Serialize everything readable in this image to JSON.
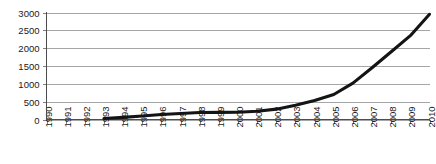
{
  "chart_data": {
    "type": "line",
    "title": "",
    "subtitle": "",
    "xlabel": "",
    "ylabel": "",
    "grid": "horizontal",
    "legend": "none",
    "xlim": [
      1990,
      2010
    ],
    "ylim": [
      0,
      3000
    ],
    "ytick_labels": [
      "0",
      "500",
      "1000",
      "1500",
      "2000",
      "2500",
      "3000"
    ],
    "ytick_values": [
      0,
      500,
      1000,
      1500,
      2000,
      2500,
      3000
    ],
    "xtick_labels": [
      "1990",
      "1991",
      "1992",
      "1993",
      "1994",
      "1995",
      "1996",
      "1997",
      "1998",
      "1999",
      "2000",
      "2001",
      "2002",
      "2003",
      "2004",
      "2005",
      "2006",
      "2007",
      "2008",
      "2009",
      "2010"
    ],
    "x": [
      1993,
      1994,
      1995,
      1996,
      1997,
      1998,
      1999,
      2000,
      2001,
      2002,
      2003,
      2004,
      2005,
      2006,
      2007,
      2008,
      2009,
      2010
    ],
    "values": [
      30,
      60,
      100,
      140,
      170,
      195,
      200,
      205,
      230,
      290,
      400,
      530,
      700,
      1020,
      1450,
      1900,
      2350,
      2950
    ],
    "series": [
      {
        "name": "series-1",
        "color": "#141414",
        "x": [
          1993,
          1994,
          1995,
          1996,
          1997,
          1998,
          1999,
          2000,
          2001,
          2002,
          2003,
          2004,
          2005,
          2006,
          2007,
          2008,
          2009,
          2010
        ],
        "values": [
          30,
          60,
          100,
          140,
          170,
          195,
          200,
          205,
          230,
          290,
          400,
          530,
          700,
          1020,
          1450,
          1900,
          2350,
          2950
        ]
      }
    ],
    "colors": {
      "line": "#141414",
      "grid": "#a6a6a6",
      "axis": "#4d4d4d",
      "background": "#ffffff",
      "text": "#1a1a1a"
    }
  }
}
